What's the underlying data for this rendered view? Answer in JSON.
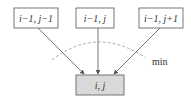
{
  "diagram": {
    "nodes": [
      {
        "id": "top-left",
        "label": "i−1,  j−1",
        "fill": "#ffffff"
      },
      {
        "id": "top-middle",
        "label": "i−1,  j",
        "fill": "#ffffff"
      },
      {
        "id": "top-right",
        "label": "i−1,  j+1",
        "fill": "#ffffff"
      },
      {
        "id": "target",
        "label": "i,  j",
        "fill": "#d9d9d9"
      }
    ],
    "edges": [
      {
        "from": "top-left",
        "to": "target"
      },
      {
        "from": "top-middle",
        "to": "target"
      },
      {
        "from": "top-right",
        "to": "target"
      }
    ],
    "annotation": {
      "label": "min",
      "style": "dashed-arc"
    },
    "colors": {
      "stroke": "#555555",
      "dashed": "#999999",
      "target_fill": "#d9d9d9"
    }
  }
}
